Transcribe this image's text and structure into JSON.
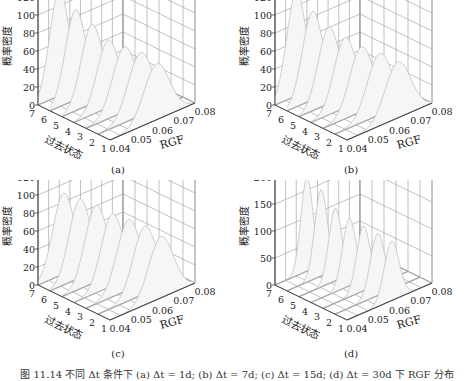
{
  "figure": {
    "caption": "图 11.14  不同 Δt 条件下 (a) Δt = 1d; (b) Δt = 7d; (c) Δt = 15d; (d) Δt = 30d 下 RGF 分布"
  },
  "chart_data": [
    {
      "type": "surface",
      "panel_label": "(a)",
      "xlabel": "RGF",
      "ylabel": "过去状态",
      "zlabel": "概率密度",
      "x_ticks": [
        "0.04",
        "0.05",
        "0.06",
        "0.07",
        "0.08"
      ],
      "y_ticks": [
        "1",
        "2",
        "3",
        "4",
        "5",
        "6",
        "7"
      ],
      "z_ticks": [
        "0",
        "20",
        "40",
        "60",
        "80",
        "100",
        "120"
      ],
      "xlim": [
        0.04,
        0.08
      ],
      "ylim": [
        1,
        7
      ],
      "zlim": [
        0,
        120
      ],
      "series": [
        {
          "name": "state 7",
          "peak_x": 0.05,
          "peak_z": 118,
          "width": 0.0045
        },
        {
          "name": "state 6",
          "peak_x": 0.052,
          "peak_z": 100,
          "width": 0.0048
        },
        {
          "name": "state 5",
          "peak_x": 0.054,
          "peak_z": 88,
          "width": 0.005
        },
        {
          "name": "state 4",
          "peak_x": 0.056,
          "peak_z": 75,
          "width": 0.0052
        },
        {
          "name": "state 3",
          "peak_x": 0.058,
          "peak_z": 72,
          "width": 0.0055
        },
        {
          "name": "state 2",
          "peak_x": 0.06,
          "peak_z": 70,
          "width": 0.0058
        },
        {
          "name": "state 1",
          "peak_x": 0.062,
          "peak_z": 62,
          "width": 0.006
        }
      ]
    },
    {
      "type": "surface",
      "panel_label": "(b)",
      "xlabel": "RGF",
      "ylabel": "过去状态",
      "zlabel": "概率密度",
      "x_ticks": [
        "0.04",
        "0.05",
        "0.06",
        "0.07",
        "0.08"
      ],
      "y_ticks": [
        "1",
        "2",
        "3",
        "4",
        "5",
        "6",
        "7"
      ],
      "z_ticks": [
        "0",
        "20",
        "40",
        "60",
        "80",
        "100",
        "120"
      ],
      "xlim": [
        0.04,
        0.08
      ],
      "ylim": [
        1,
        7
      ],
      "zlim": [
        0,
        120
      ],
      "series": [
        {
          "name": "state 7",
          "peak_x": 0.05,
          "peak_z": 115,
          "width": 0.0045
        },
        {
          "name": "state 6",
          "peak_x": 0.052,
          "peak_z": 98,
          "width": 0.0048
        },
        {
          "name": "state 5",
          "peak_x": 0.054,
          "peak_z": 85,
          "width": 0.005
        },
        {
          "name": "state 4",
          "peak_x": 0.056,
          "peak_z": 78,
          "width": 0.0052
        },
        {
          "name": "state 3",
          "peak_x": 0.058,
          "peak_z": 72,
          "width": 0.0055
        },
        {
          "name": "state 2",
          "peak_x": 0.061,
          "peak_z": 68,
          "width": 0.0058
        },
        {
          "name": "state 1",
          "peak_x": 0.064,
          "peak_z": 62,
          "width": 0.006
        }
      ]
    },
    {
      "type": "surface",
      "panel_label": "(c)",
      "xlabel": "RGF",
      "ylabel": "过去状态",
      "zlabel": "概率密度",
      "x_ticks": [
        "0.04",
        "0.05",
        "0.06",
        "0.07",
        "0.08"
      ],
      "y_ticks": [
        "1",
        "2",
        "3",
        "4",
        "5",
        "6",
        "7"
      ],
      "z_ticks": [
        "0",
        "20",
        "40",
        "60",
        "80",
        "100",
        "120"
      ],
      "xlim": [
        0.04,
        0.08
      ],
      "ylim": [
        1,
        7
      ],
      "zlim": [
        0,
        120
      ],
      "series": [
        {
          "name": "state 7",
          "peak_x": 0.052,
          "peak_z": 90,
          "width": 0.005
        },
        {
          "name": "state 6",
          "peak_x": 0.054,
          "peak_z": 88,
          "width": 0.005
        },
        {
          "name": "state 5",
          "peak_x": 0.056,
          "peak_z": 85,
          "width": 0.0052
        },
        {
          "name": "state 4",
          "peak_x": 0.058,
          "peak_z": 80,
          "width": 0.0052
        },
        {
          "name": "state 3",
          "peak_x": 0.06,
          "peak_z": 78,
          "width": 0.0055
        },
        {
          "name": "state 2",
          "peak_x": 0.062,
          "peak_z": 75,
          "width": 0.0055
        },
        {
          "name": "state 1",
          "peak_x": 0.064,
          "peak_z": 68,
          "width": 0.0058
        }
      ]
    },
    {
      "type": "surface",
      "panel_label": "(d)",
      "xlabel": "RGF",
      "ylabel": "过去状态",
      "zlabel": "概率密度",
      "x_ticks": [
        "0.04",
        "0.05",
        "0.06",
        "0.07",
        "0.08"
      ],
      "y_ticks": [
        "1",
        "2",
        "3",
        "4",
        "5",
        "6",
        "7"
      ],
      "z_ticks": [
        "0",
        "50",
        "100",
        "150",
        "200"
      ],
      "xlim": [
        0.04,
        0.08
      ],
      "ylim": [
        1,
        7
      ],
      "zlim": [
        0,
        200
      ],
      "series": [
        {
          "name": "state 7",
          "peak_x": 0.055,
          "peak_z": 175,
          "width": 0.0028
        },
        {
          "name": "state 6",
          "peak_x": 0.056,
          "peak_z": 160,
          "width": 0.003
        },
        {
          "name": "state 5",
          "peak_x": 0.057,
          "peak_z": 135,
          "width": 0.003
        },
        {
          "name": "state 4",
          "peak_x": 0.058,
          "peak_z": 125,
          "width": 0.0032
        },
        {
          "name": "state 3",
          "peak_x": 0.059,
          "peak_z": 120,
          "width": 0.0032
        },
        {
          "name": "state 2",
          "peak_x": 0.06,
          "peak_z": 115,
          "width": 0.0034
        },
        {
          "name": "state 1",
          "peak_x": 0.061,
          "peak_z": 110,
          "width": 0.0035
        }
      ]
    }
  ]
}
